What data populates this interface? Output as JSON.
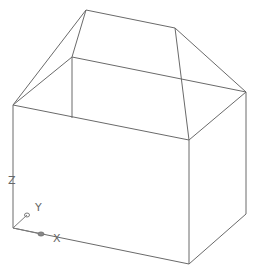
{
  "view": {
    "background": "#ffffff",
    "line_color": "#6a6a6a"
  },
  "model": {
    "name": "box-with-hip-roof",
    "vertices": {
      "roof_top_left": [
        86,
        10
      ],
      "roof_top_right": [
        175,
        28
      ],
      "back_left": [
        72,
        57
      ],
      "left": [
        13,
        105
      ],
      "right": [
        246,
        92
      ],
      "front_top_right": [
        189,
        140
      ],
      "back_left_bottom": [
        72,
        118
      ],
      "front_bottom_left": [
        13,
        228
      ],
      "front_bottom_right": [
        189,
        264
      ],
      "right_bottom": [
        246,
        214
      ]
    }
  },
  "ucs": {
    "x_label": "X",
    "y_label": "Y",
    "z_label": "Z"
  }
}
